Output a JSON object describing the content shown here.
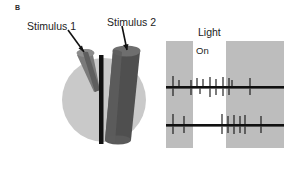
{
  "figure": {
    "panel_letter": "B",
    "background_color": "#ffffff"
  },
  "diagram": {
    "stimulus1_label": "Stimulus 1",
    "stimulus2_label": "Stimulus 2",
    "receptive_field_color": "#c9c9c9",
    "stimulus1_cone_color": "#7c7c7c",
    "stimulus2_cone_color": "#4f4f4f",
    "bar_color": "#111111",
    "arrow_color": "#111111"
  },
  "recording": {
    "light_label": "Light",
    "bands": [
      {
        "label": "Off",
        "shaded": true
      },
      {
        "label": "On",
        "shaded": false
      },
      {
        "label": "Off",
        "shaded": true
      }
    ],
    "band_shade_color": "#bdbdbd",
    "trace_color": "#101010",
    "traces": [
      {
        "name": "trace-top",
        "spikes_up": [
          7,
          13,
          25,
          31,
          37,
          44,
          50,
          57,
          63,
          66,
          84
        ],
        "spikes_down": [
          7,
          25,
          34,
          44,
          50,
          57,
          63,
          84
        ]
      },
      {
        "name": "trace-bottom",
        "spikes_up": [
          7,
          18,
          56,
          62,
          68,
          74,
          79,
          95
        ],
        "spikes_down": [
          7,
          18,
          56,
          62,
          68,
          74,
          79,
          95
        ]
      }
    ]
  }
}
